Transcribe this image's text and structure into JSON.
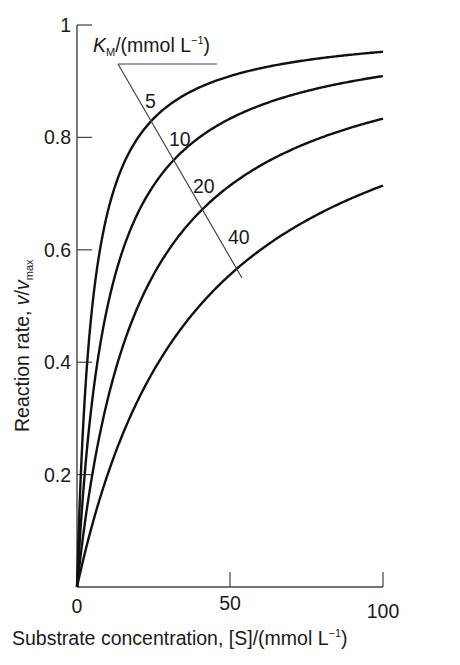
{
  "chart_data": {
    "type": "line",
    "title": "",
    "xlabel": "Substrate concentration, [S]/(mmol L⁻¹)",
    "xlabel_parts": {
      "main": "Substrate concentration, [S]/(mmol L",
      "sup": "−1",
      "close": ")"
    },
    "ylabel_parts": {
      "main": "Reaction rate, ",
      "v": "v",
      "slash": "/",
      "v2": "v",
      "sub": "max"
    },
    "ylabel": "Reaction rate, v/v_max",
    "xlim": [
      0,
      100
    ],
    "ylim": [
      0,
      1
    ],
    "xticks": [
      {
        "value": 0,
        "label": "0"
      },
      {
        "value": 50,
        "label": "50"
      },
      {
        "value": 100,
        "label": "100"
      }
    ],
    "yticks": [
      {
        "value": 0.2,
        "label": "0.2"
      },
      {
        "value": 0.4,
        "label": "0.4"
      },
      {
        "value": 0.6,
        "label": "0.6"
      },
      {
        "value": 0.8,
        "label": "0.8"
      },
      {
        "value": 1.0,
        "label": "1"
      }
    ],
    "grid": false,
    "formula": "v/v_max = [S]/(K_M + [S])",
    "legend_title": {
      "k": "K",
      "sub": "M",
      "rest": "/(mmol L",
      "sup": "−1",
      "close": ")"
    },
    "series": [
      {
        "name": "5",
        "km": 5,
        "x": [
          0,
          5,
          10,
          20,
          50,
          100
        ],
        "values": [
          0,
          0.5,
          0.667,
          0.8,
          0.909,
          0.952
        ]
      },
      {
        "name": "10",
        "km": 10,
        "x": [
          0,
          5,
          10,
          20,
          50,
          100
        ],
        "values": [
          0,
          0.333,
          0.5,
          0.667,
          0.833,
          0.909
        ]
      },
      {
        "name": "20",
        "km": 20,
        "x": [
          0,
          5,
          10,
          20,
          50,
          100
        ],
        "values": [
          0,
          0.2,
          0.333,
          0.5,
          0.714,
          0.833
        ]
      },
      {
        "name": "40",
        "km": 40,
        "x": [
          0,
          5,
          10,
          20,
          50,
          100
        ],
        "values": [
          0,
          0.111,
          0.2,
          0.333,
          0.556,
          0.714
        ]
      }
    ],
    "colors": {
      "curve": "#111111",
      "axis": "#444444",
      "text": "#1a1a1a"
    }
  }
}
